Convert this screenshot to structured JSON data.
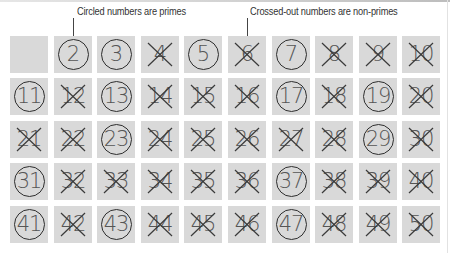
{
  "annotations": {
    "primes_note": "Circled numbers are primes",
    "nonprimes_note": "Crossed-out numbers are non-primes"
  },
  "legend": {
    "circled": "prime",
    "crossed_out": "non-prime"
  },
  "grid": {
    "rows": 5,
    "columns": 10,
    "cells": [
      {
        "n": "",
        "type": "blank"
      },
      {
        "n": "2",
        "type": "prime"
      },
      {
        "n": "3",
        "type": "prime"
      },
      {
        "n": "4",
        "type": "nonprime"
      },
      {
        "n": "5",
        "type": "prime"
      },
      {
        "n": "6",
        "type": "nonprime"
      },
      {
        "n": "7",
        "type": "prime"
      },
      {
        "n": "8",
        "type": "nonprime"
      },
      {
        "n": "9",
        "type": "nonprime"
      },
      {
        "n": "10",
        "type": "nonprime"
      },
      {
        "n": "11",
        "type": "prime"
      },
      {
        "n": "12",
        "type": "nonprime"
      },
      {
        "n": "13",
        "type": "prime"
      },
      {
        "n": "14",
        "type": "nonprime"
      },
      {
        "n": "15",
        "type": "nonprime"
      },
      {
        "n": "16",
        "type": "nonprime"
      },
      {
        "n": "17",
        "type": "prime"
      },
      {
        "n": "18",
        "type": "nonprime"
      },
      {
        "n": "19",
        "type": "prime"
      },
      {
        "n": "20",
        "type": "nonprime"
      },
      {
        "n": "21",
        "type": "nonprime"
      },
      {
        "n": "22",
        "type": "nonprime"
      },
      {
        "n": "23",
        "type": "prime"
      },
      {
        "n": "24",
        "type": "nonprime"
      },
      {
        "n": "25",
        "type": "nonprime"
      },
      {
        "n": "26",
        "type": "nonprime"
      },
      {
        "n": "27",
        "type": "nonprime"
      },
      {
        "n": "28",
        "type": "nonprime"
      },
      {
        "n": "29",
        "type": "prime"
      },
      {
        "n": "30",
        "type": "nonprime"
      },
      {
        "n": "31",
        "type": "prime"
      },
      {
        "n": "32",
        "type": "nonprime"
      },
      {
        "n": "33",
        "type": "nonprime"
      },
      {
        "n": "34",
        "type": "nonprime"
      },
      {
        "n": "35",
        "type": "nonprime"
      },
      {
        "n": "36",
        "type": "nonprime"
      },
      {
        "n": "37",
        "type": "prime"
      },
      {
        "n": "38",
        "type": "nonprime"
      },
      {
        "n": "39",
        "type": "nonprime"
      },
      {
        "n": "40",
        "type": "nonprime"
      },
      {
        "n": "41",
        "type": "prime"
      },
      {
        "n": "42",
        "type": "nonprime"
      },
      {
        "n": "43",
        "type": "prime"
      },
      {
        "n": "44",
        "type": "nonprime"
      },
      {
        "n": "45",
        "type": "nonprime"
      },
      {
        "n": "46",
        "type": "nonprime"
      },
      {
        "n": "47",
        "type": "prime"
      },
      {
        "n": "48",
        "type": "nonprime"
      },
      {
        "n": "49",
        "type": "nonprime"
      },
      {
        "n": "50",
        "type": "nonprime"
      }
    ]
  },
  "colors": {
    "cell_bg": "#d9d9d9",
    "digit": "#555555",
    "mark": "#2e2e2e"
  }
}
